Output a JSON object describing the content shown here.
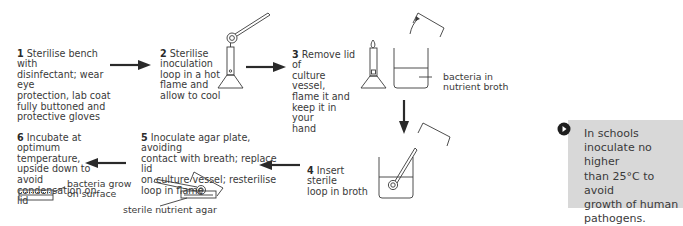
{
  "diagram": {
    "steps": [
      {
        "number": "1",
        "text": "Sterilise bench with\ndisinfectant; wear eye\nprotection, lab coat\nfully buttoned and\nprotective gloves"
      },
      {
        "number": "2",
        "text": "Sterilise\ninoculation\nloop in a hot\nflame and\nallow to cool"
      },
      {
        "number": "3",
        "text": "Remove lid of\nculture vessel,\nflame it and\nkeep it in your\nhand"
      },
      {
        "number": "4",
        "text": "Insert sterile\nloop in broth"
      },
      {
        "number": "5",
        "text": "Inoculate agar plate, avoiding\ncontact with breath; replace lid\non culture vessel; resterilise\nloop in flame"
      },
      {
        "number": "6",
        "text": "Incubate at\noptimum temperature,\nupside down to avoid\ncondensation on\nlid"
      }
    ],
    "labels": {
      "broth": "bacteria in\nnutrient broth",
      "agar": "sterile nutrient agar",
      "growth": "bacteria grow\non surface"
    },
    "icons": [
      "bunsen-burner-icon",
      "inoculation-loop-icon",
      "culture-vessel-icon",
      "petri-dish-icon",
      "arrow-icon",
      "note-bullet-icon"
    ],
    "colors": {
      "line": "#3a3a3a",
      "arrow": "#2a2a2a",
      "note_bg": "#d8d8d8"
    }
  },
  "note": {
    "text": "In schools\ninoculate no higher\nthan 25°C to avoid\ngrowth of human\npathogens."
  }
}
